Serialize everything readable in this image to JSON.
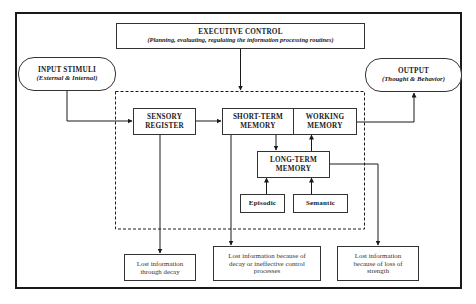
{
  "diagram": {
    "executive_control": {
      "title": "EXECUTIVE CONTROL",
      "subtitle": "(Planning, evaluating, regulating the information processing routines)"
    },
    "input": {
      "title": "INPUT STIMULI",
      "subtitle": "(External & Internal)"
    },
    "output": {
      "title": "OUTPUT",
      "subtitle": "(Thought & Behavior)"
    },
    "sensory_register": {
      "line1": "SENSORY",
      "line2": "REGISTER"
    },
    "short_term_memory": {
      "line1": "SHORT-TERM",
      "line2": "MEMORY"
    },
    "working_memory": {
      "line1": "WORKING",
      "line2": "MEMORY"
    },
    "long_term_memory": {
      "line1": "LONG-TERM",
      "line2": "MEMORY"
    },
    "episodic": "Episodic",
    "semantic": "Semantic",
    "losses": [
      {
        "line1": "Lost information",
        "line2": "through decay"
      },
      {
        "line1": "Lost information because of",
        "line2": "decay or ineffective control",
        "line3": "processes"
      },
      {
        "line1": "Lost information",
        "line2": "because of loss of",
        "line3": "strength"
      }
    ],
    "colors": {
      "line": "#1a1a1a",
      "box_border": "#333333",
      "background": "#ffffff"
    }
  }
}
